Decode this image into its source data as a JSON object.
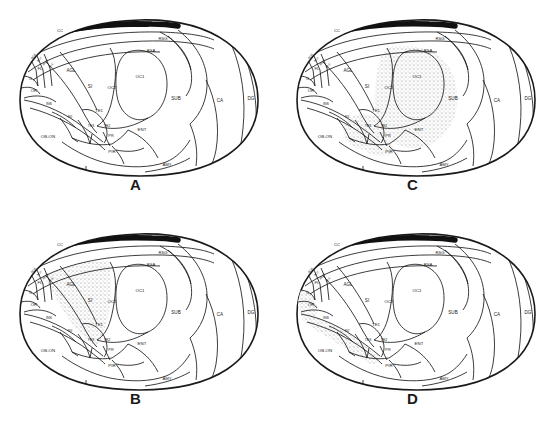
{
  "figure": {
    "panel_count": 4,
    "background_color": "#ffffff",
    "line_color": "#1a1a1a",
    "stipple_color": "#8a8a8a",
    "callosum_color": "#111111"
  },
  "panels": [
    {
      "id": "A",
      "letter": "A",
      "position": "top-left",
      "shaded_regions": [],
      "shading_note": "no stippling"
    },
    {
      "id": "B",
      "letter": "B",
      "position": "bottom-left",
      "shaded_regions": [
        "AGL",
        "SI"
      ],
      "shading_note": "stippling over AGL and SI"
    },
    {
      "id": "C",
      "letter": "C",
      "position": "top-right",
      "shaded_regions": [
        "OC1",
        "OC2",
        "TE1",
        "TE3",
        "TE2",
        "PR"
      ],
      "shading_note": "stippling over occipital and temporal areas"
    },
    {
      "id": "D",
      "letter": "D",
      "position": "bottom-right",
      "shaded_regions": [
        "IL",
        "OR",
        "INS",
        "SII"
      ],
      "shading_note": "stippling over infralimbic, orbital and insular strip"
    }
  ],
  "region_labels": {
    "CC": "CC",
    "RSG": "RSG",
    "RSA": "RSA",
    "ACd": "ACd",
    "ACv": "ACv",
    "AGm": "AGm",
    "PLC": "PLC",
    "FL": "FL",
    "IL": "IL",
    "OR": "OR",
    "AGL": "AGL",
    "SI": "SI",
    "OC2": "OC2",
    "OC1": "OC1",
    "SUB": "SUB",
    "CA": "CA",
    "DG": "DG",
    "INS": "INS",
    "SII": "SII",
    "TE1": "TE1",
    "TE2": "TE2",
    "TE3": "TE3",
    "PR": "PR",
    "ENT": "ENT",
    "OB_ON": "OB-ON",
    "PIR": "PIR",
    "AMY": "AMY"
  },
  "labels_list": [
    "CC",
    "RSG",
    "RSA",
    "ACd",
    "ACv",
    "AGm",
    "PLC",
    "FL",
    "IL",
    "OR",
    "AGL",
    "SI",
    "OC2",
    "OC1",
    "SUB",
    "CA",
    "DG",
    "INS",
    "SII",
    "TE1",
    "TE2",
    "TE3",
    "PR",
    "ENT",
    "OB-ON",
    "PIR",
    "AMY"
  ]
}
